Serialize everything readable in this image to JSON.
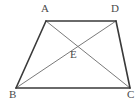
{
  "figure": {
    "type": "geometry-diagram",
    "shape": "trapezoid-with-diagonals",
    "width": 140,
    "height": 109,
    "background_color": "#ffffff",
    "outline_color": "#3a3a3a",
    "diagonal_color": "#7a7a7a",
    "label_color": "#4a4a4a",
    "outline_width": 1.6,
    "diagonal_width": 1,
    "points": {
      "A": {
        "label": "A",
        "x": 46,
        "y": 21
      },
      "D": {
        "label": "D",
        "x": 116,
        "y": 21
      },
      "B": {
        "label": "B",
        "x": 16,
        "y": 88
      },
      "C": {
        "label": "C",
        "x": 130,
        "y": 88
      },
      "E": {
        "label": "E",
        "x": 74,
        "y": 43
      }
    },
    "edges": [
      {
        "name": "AD",
        "from": "A",
        "to": "D",
        "style": "outline"
      },
      {
        "name": "DC",
        "from": "D",
        "to": "C",
        "style": "outline"
      },
      {
        "name": "CB",
        "from": "C",
        "to": "B",
        "style": "outline"
      },
      {
        "name": "BA",
        "from": "B",
        "to": "A",
        "style": "outline"
      },
      {
        "name": "AC",
        "from": "A",
        "to": "C",
        "style": "diagonal"
      },
      {
        "name": "BD",
        "from": "B",
        "to": "D",
        "style": "diagonal"
      }
    ],
    "labels": {
      "A": "A",
      "B": "B",
      "C": "C",
      "D": "D",
      "E": "E"
    }
  }
}
